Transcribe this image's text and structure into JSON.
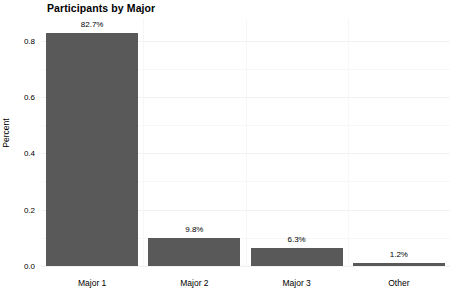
{
  "chart_data": {
    "type": "bar",
    "title": "Participants by Major",
    "xlabel": "",
    "ylabel": "Percent",
    "categories": [
      "Major 1",
      "Major 2",
      "Major 3",
      "Other"
    ],
    "values": [
      0.827,
      0.098,
      0.063,
      0.012
    ],
    "data_labels": [
      "82.7%",
      "9.8%",
      "6.3%",
      "1.2%"
    ],
    "ylim": [
      0.0,
      0.88
    ],
    "ytick_values": [
      0.0,
      0.2,
      0.4,
      0.6,
      0.8
    ],
    "ytick_labels": [
      "0.0",
      "0.2",
      "0.4",
      "0.6",
      "0.8"
    ],
    "grid": true,
    "legend": "none",
    "bar_color": "#595959",
    "background_color": "#ffffff",
    "gridline_color": "#f5f5f5",
    "text_color": "#000000"
  }
}
